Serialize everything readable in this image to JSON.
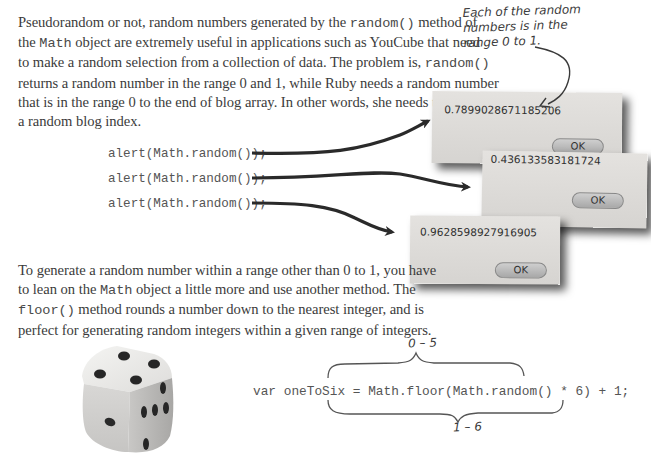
{
  "paragraph1": {
    "lines": [
      [
        "Pseudorandom or not, random numbers generated by the ",
        "random()",
        " method of"
      ],
      [
        "the ",
        "Math",
        " object are extremely useful in applications such as YouCube that need"
      ],
      [
        "to make a random selection from a collection of data. The problem is, ",
        "random()",
        ""
      ],
      [
        "returns a random number in the range 0 and 1, while Ruby needs a random number",
        "",
        ""
      ],
      [
        "that is in the range 0 to the end of blog array. In other words, she needs to generate",
        "",
        ""
      ],
      [
        "a random blog index.",
        "",
        ""
      ]
    ]
  },
  "annotation": {
    "line1": "Each of the random",
    "line2": "numbers is in the",
    "line3": "range 0 to 1."
  },
  "code_calls": [
    "alert(Math.random());",
    "alert(Math.random());",
    "alert(Math.random());"
  ],
  "dialogs": [
    {
      "value": "0.7899028671185206",
      "button": "OK"
    },
    {
      "value": "0.436133583181724",
      "button": "OK"
    },
    {
      "value": "0.9628598927916905",
      "button": "OK"
    }
  ],
  "paragraph2": {
    "lines": [
      [
        "To generate a random number within a range other than 0 to 1, you have",
        "",
        ""
      ],
      [
        "to lean on the ",
        "Math",
        " object a little more and use another method. The"
      ],
      [
        "",
        "floor()",
        " method rounds a number down to the nearest integer, and is"
      ],
      [
        "perfect for generating random integers within a given range of integers.",
        "",
        ""
      ]
    ]
  },
  "formula": {
    "code": "var oneToSix = Math.floor(Math.random() * 6) + 1;",
    "top_brace_label": "0 – 5",
    "bottom_brace_label": "1 – 6"
  },
  "image": {
    "subject": "dice-photo"
  }
}
